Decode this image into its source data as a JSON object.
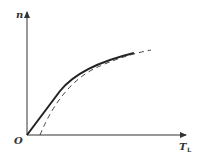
{
  "diagram": {
    "type": "line",
    "y_axis_label": "n",
    "x_axis_label": "T",
    "x_axis_subscript": "L",
    "origin_label": "O",
    "series": [
      {
        "name": "solid-curve",
        "style": "solid",
        "color": "#222222"
      },
      {
        "name": "dashed-curve",
        "style": "dashed",
        "color": "#444444"
      }
    ]
  }
}
